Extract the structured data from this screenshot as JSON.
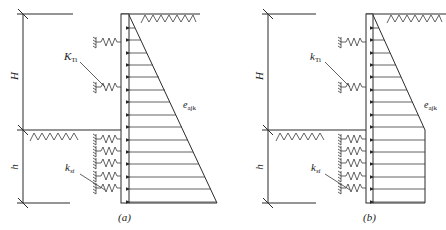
{
  "figure": {
    "panels": [
      {
        "id": "a",
        "caption": "(a)",
        "labels": {
          "upper_dimension": "H",
          "lower_dimension": "h",
          "upper_spring": "K",
          "upper_spring_sub": "Ti",
          "lower_spring": "k",
          "lower_spring_sub": "si",
          "pressure": "e",
          "pressure_sub": "ajk"
        },
        "pressure_shape": "triangular"
      },
      {
        "id": "b",
        "caption": "(b)",
        "labels": {
          "upper_dimension": "H",
          "lower_dimension": "h",
          "upper_spring": "k",
          "upper_spring_sub": "Ti",
          "lower_spring": "k",
          "lower_spring_sub": "si",
          "pressure": "e",
          "pressure_sub": "ajk"
        },
        "pressure_shape": "triangular-then-rectangular"
      }
    ]
  }
}
